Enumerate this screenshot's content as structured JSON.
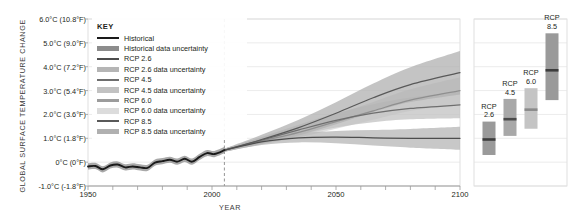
{
  "chart_data": {
    "type": "line",
    "title": "",
    "xlabel": "YEAR",
    "ylabel": "GLOBAL SURFACE TEMPERATURE CHANGE",
    "xlim": [
      1950,
      2100
    ],
    "ylim": [
      -1.0,
      6.0
    ],
    "grid": true,
    "legend_position": "top-left",
    "historical_split_year": 2005,
    "x_ticks": [
      {
        "value": 1950,
        "label": "1950"
      },
      {
        "value": 1960,
        "label": ""
      },
      {
        "value": 1970,
        "label": ""
      },
      {
        "value": 1980,
        "label": ""
      },
      {
        "value": 1990,
        "label": ""
      },
      {
        "value": 2000,
        "label": "2000"
      },
      {
        "value": 2010,
        "label": ""
      },
      {
        "value": 2020,
        "label": ""
      },
      {
        "value": 2030,
        "label": ""
      },
      {
        "value": 2040,
        "label": ""
      },
      {
        "value": 2050,
        "label": "2050"
      },
      {
        "value": 2060,
        "label": ""
      },
      {
        "value": 2070,
        "label": ""
      },
      {
        "value": 2080,
        "label": ""
      },
      {
        "value": 2090,
        "label": ""
      },
      {
        "value": 2100,
        "label": "2100"
      }
    ],
    "y_ticks": [
      {
        "value": 6.0,
        "label": "6.0°C  (10.8°F)"
      },
      {
        "value": 5.0,
        "label": "5.0°C  (9.0°F)"
      },
      {
        "value": 4.0,
        "label": "4.0°C  (7.2°F)"
      },
      {
        "value": 3.0,
        "label": "3.0°C  (5.4°F)"
      },
      {
        "value": 2.0,
        "label": "2.0°C  (3.6°F)"
      },
      {
        "value": 1.0,
        "label": "1.0°C  (1.8°F)"
      },
      {
        "value": 0.0,
        "label": "0°C  (0°F)"
      },
      {
        "value": -1.0,
        "label": "-1.0°C  (-1.8°F)"
      }
    ],
    "series": [
      {
        "name": "Historical",
        "color": "#1a1a1a",
        "band_color": "#8c8c8c",
        "x": [
          1950,
          1953,
          1956,
          1959,
          1962,
          1965,
          1968,
          1971,
          1974,
          1977,
          1980,
          1983,
          1986,
          1989,
          1992,
          1995,
          1998,
          2001,
          2005
        ],
        "values": [
          -0.18,
          -0.16,
          -0.3,
          -0.14,
          -0.1,
          -0.22,
          -0.18,
          -0.22,
          -0.24,
          -0.02,
          0.04,
          0.1,
          0.02,
          0.14,
          0.02,
          0.22,
          0.38,
          0.34,
          0.5
        ],
        "band_half_width": 0.13
      },
      {
        "name": "RCP 2.6",
        "color": "#4d4d4d",
        "band_color": "#b5b5b5",
        "x": [
          2005,
          2020,
          2035,
          2050,
          2065,
          2080,
          2100
        ],
        "values": [
          0.5,
          0.85,
          1.02,
          1.05,
          1.02,
          1.0,
          1.0
        ],
        "band_half_width": 0.42
      },
      {
        "name": "RCP 4.5",
        "color": "#6e6e6e",
        "band_color": "#c2c2c2",
        "x": [
          2005,
          2020,
          2035,
          2050,
          2065,
          2080,
          2100
        ],
        "values": [
          0.5,
          0.92,
          1.35,
          1.75,
          2.05,
          2.25,
          2.4
        ],
        "band_half_width": 0.5
      },
      {
        "name": "RCP 6.0",
        "color": "#8f8f8f",
        "band_color": "#d4d4d4",
        "x": [
          2005,
          2020,
          2035,
          2050,
          2065,
          2080,
          2100
        ],
        "values": [
          0.5,
          0.88,
          1.25,
          1.7,
          2.15,
          2.6,
          3.0
        ],
        "band_half_width": 0.5
      },
      {
        "name": "RCP 8.5",
        "color": "#595959",
        "band_color": "#b0b0b0",
        "x": [
          2005,
          2020,
          2035,
          2050,
          2065,
          2080,
          2100
        ],
        "values": [
          0.5,
          0.95,
          1.45,
          2.05,
          2.7,
          3.25,
          3.75
        ],
        "band_half_width": 0.85
      }
    ],
    "side_panel": {
      "bars": [
        {
          "label_line1": "RCP",
          "label_line2": "2.6",
          "low": 0.3,
          "high": 1.7,
          "median": 0.95,
          "color": "#9a9a9a",
          "median_color": "#3d3d3d"
        },
        {
          "label_line1": "RCP",
          "label_line2": "4.5",
          "low": 1.1,
          "high": 2.65,
          "median": 1.8,
          "color": "#a8a8a8",
          "median_color": "#4a4a4a"
        },
        {
          "label_line1": "RCP",
          "label_line2": "6.0",
          "low": 1.4,
          "high": 3.1,
          "median": 2.2,
          "color": "#c4c4c4",
          "median_color": "#8a8a8a"
        },
        {
          "label_line1": "RCP",
          "label_line2": "8.5",
          "low": 2.6,
          "high": 5.4,
          "median": 3.85,
          "color": "#9a9a9a",
          "median_color": "#3d3d3d"
        }
      ]
    }
  },
  "legend": {
    "title": "KEY",
    "items": [
      {
        "label": "Historical",
        "kind": "line",
        "color": "#1a1a1a"
      },
      {
        "label": "Historical data uncertainty",
        "kind": "band",
        "color": "#8c8c8c"
      },
      {
        "label": "RCP 2.6",
        "kind": "line",
        "color": "#4d4d4d"
      },
      {
        "label": "RCP 2.6 data uncertainty",
        "kind": "band",
        "color": "#b5b5b5"
      },
      {
        "label": "RCP 4.5",
        "kind": "line",
        "color": "#6e6e6e"
      },
      {
        "label": "RCP 4.5 data uncertainty",
        "kind": "band",
        "color": "#c2c2c2"
      },
      {
        "label": "RCP 6.0",
        "kind": "line",
        "color": "#9c9c9c"
      },
      {
        "label": "RCP 6.0 data uncertainty",
        "kind": "band",
        "color": "#dcdcdc"
      },
      {
        "label": "RCP 8.5",
        "kind": "line",
        "color": "#595959"
      },
      {
        "label": "RCP 8.5 data uncertainty",
        "kind": "band",
        "color": "#b0b0b0"
      }
    ]
  },
  "colors": {
    "axis": "#9b9b9b",
    "grid": "#e3e3e3",
    "frame": "#d8d8d8",
    "divider": "#8a8a8a",
    "text": "#231f20"
  }
}
